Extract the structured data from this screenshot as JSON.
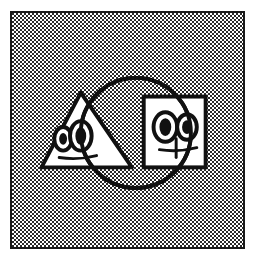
{
  "image": {
    "title": "Three overlapping geometric shapes with cartoon faces",
    "width": 257,
    "height": 255,
    "style": "black and white line drawing with halftone stipple background"
  },
  "frame": {
    "name": "artwork-frame",
    "border_color": "#1a1a1a",
    "border_width": 2,
    "background_color": "#ffffff",
    "pattern": "halftone-dot-stipple",
    "pattern_dot_color": "#2a2a2a",
    "x": 10,
    "y": 11,
    "width": 235,
    "height": 238
  },
  "shapes": [
    {
      "id": "triangle",
      "name": "triangle-shape",
      "label": "Triangle",
      "fill": "#ffffff",
      "stroke": "#111111",
      "stroke_width": 4,
      "points": "80,92 132,168 40,168",
      "z": 1,
      "face": {
        "eyes": 2,
        "mouth": "straight-line"
      }
    },
    {
      "id": "square",
      "name": "square-shape",
      "label": "Square",
      "fill": "#ffffff",
      "stroke": "#111111",
      "stroke_width": 4,
      "x": 144,
      "y": 96,
      "width": 63,
      "height": 72,
      "z": 2,
      "face": {
        "eyes": 2,
        "mouth": "straight-line"
      }
    },
    {
      "id": "circle",
      "name": "circle-shape",
      "label": "Circle",
      "fill": "none",
      "stroke": "#111111",
      "stroke_width": 4,
      "cx": 136,
      "cy": 133,
      "r": 56,
      "z": 3
    }
  ],
  "faces": [
    {
      "id": "face-left",
      "name": "face-left",
      "belongs_to": "triangle",
      "eyes": [
        {
          "name": "eye-outer-left",
          "cx": 62,
          "cy": 139,
          "rx": 9,
          "ry": 12,
          "pupil_rx": 4,
          "pupil_ry": 6
        },
        {
          "name": "eye-inner-left",
          "cx": 80,
          "cy": 136,
          "rx": 11,
          "ry": 15,
          "pupil_rx": 5.5,
          "pupil_ry": 9
        }
      ],
      "mouth": {
        "name": "mouth-left",
        "x1": 58,
        "y1": 158,
        "x2": 96,
        "y2": 156
      }
    },
    {
      "id": "face-right",
      "name": "face-right",
      "belongs_to": "square",
      "eyes": [
        {
          "name": "eye-left-right-face",
          "cx": 166,
          "cy": 127,
          "rx": 12,
          "ry": 15,
          "pupil_rx": 6,
          "pupil_ry": 9
        },
        {
          "name": "eye-right-right-face",
          "cx": 188,
          "cy": 127,
          "rx": 10,
          "ry": 13,
          "pupil_rx": 5,
          "pupil_ry": 7
        }
      ],
      "mouth": {
        "name": "mouth-right",
        "x1": 160,
        "y1": 150,
        "x2": 195,
        "y2": 148
      }
    }
  ],
  "colors": {
    "ink": "#111111",
    "paper": "#ffffff",
    "frame_border": "#1a1a1a",
    "stipple": "#2a2a2a"
  }
}
